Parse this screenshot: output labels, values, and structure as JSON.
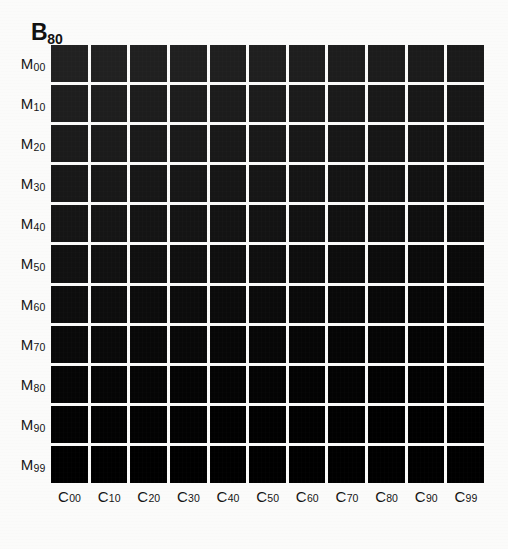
{
  "figure": {
    "title_base": "B",
    "title_sub": "80",
    "background_color": "#fbfbfa",
    "patch_border_color": "#ffffff"
  },
  "row_axis": {
    "label_base": "M",
    "labels": [
      {
        "base": "M",
        "sub": "00"
      },
      {
        "base": "M",
        "sub": "10"
      },
      {
        "base": "M",
        "sub": "20"
      },
      {
        "base": "M",
        "sub": "30"
      },
      {
        "base": "M",
        "sub": "40"
      },
      {
        "base": "M",
        "sub": "50"
      },
      {
        "base": "M",
        "sub": "60"
      },
      {
        "base": "M",
        "sub": "70"
      },
      {
        "base": "M",
        "sub": "80"
      },
      {
        "base": "M",
        "sub": "90"
      },
      {
        "base": "M",
        "sub": "99"
      }
    ]
  },
  "col_axis": {
    "label_base": "C",
    "labels": [
      {
        "base": "C",
        "sub": "00"
      },
      {
        "base": "C",
        "sub": "10"
      },
      {
        "base": "C",
        "sub": "20"
      },
      {
        "base": "C",
        "sub": "30"
      },
      {
        "base": "C",
        "sub": "40"
      },
      {
        "base": "C",
        "sub": "50"
      },
      {
        "base": "C",
        "sub": "60"
      },
      {
        "base": "C",
        "sub": "70"
      },
      {
        "base": "C",
        "sub": "80"
      },
      {
        "base": "C",
        "sub": "90"
      },
      {
        "base": "C",
        "sub": "99"
      }
    ]
  },
  "chart_data": {
    "type": "heatmap",
    "title": "B80",
    "xlabel": "",
    "ylabel": "",
    "grid": false,
    "legend_position": "none",
    "x": [
      "C00",
      "C10",
      "C20",
      "C30",
      "C40",
      "C50",
      "C60",
      "C70",
      "C80",
      "C90",
      "C99"
    ],
    "y": [
      "M00",
      "M10",
      "M20",
      "M30",
      "M40",
      "M50",
      "M60",
      "M70",
      "M80",
      "M90",
      "M99"
    ],
    "cell_colors": [
      [
        "#212121",
        "#212121",
        "#202020",
        "#202020",
        "#1f1f1f",
        "#1f1f1f",
        "#1e1e1e",
        "#1d1d1d",
        "#1c1c1c",
        "#1b1b1b",
        "#1a1a1a"
      ],
      [
        "#1e1e1e",
        "#1e1e1e",
        "#1d1d1d",
        "#1d1d1d",
        "#1c1c1c",
        "#1c1c1c",
        "#1b1b1b",
        "#1a1a1a",
        "#191919",
        "#181818",
        "#171717"
      ],
      [
        "#1b1b1b",
        "#1b1b1b",
        "#1a1a1a",
        "#1a1a1a",
        "#191919",
        "#191919",
        "#181818",
        "#171717",
        "#161616",
        "#151515",
        "#141414"
      ],
      [
        "#181818",
        "#181818",
        "#171717",
        "#171717",
        "#161616",
        "#161616",
        "#151515",
        "#141414",
        "#131313",
        "#121212",
        "#111111"
      ],
      [
        "#151515",
        "#151515",
        "#141414",
        "#141414",
        "#131313",
        "#131313",
        "#121212",
        "#111111",
        "#101010",
        "#0f0f0f",
        "#0e0e0e"
      ],
      [
        "#111111",
        "#111111",
        "#101010",
        "#101010",
        "#0f0f0f",
        "#0f0f0f",
        "#0e0e0e",
        "#0d0d0d",
        "#0c0c0c",
        "#0b0b0b",
        "#0a0a0a"
      ],
      [
        "#0d0d0d",
        "#0d0d0d",
        "#0c0c0c",
        "#0c0c0c",
        "#0b0b0b",
        "#0b0b0b",
        "#0a0a0a",
        "#090909",
        "#080808",
        "#070707",
        "#060606"
      ],
      [
        "#090909",
        "#090909",
        "#080808",
        "#080808",
        "#070707",
        "#070707",
        "#060606",
        "#050505",
        "#050505",
        "#040404",
        "#040404"
      ],
      [
        "#050505",
        "#050505",
        "#050505",
        "#040404",
        "#040404",
        "#040404",
        "#030303",
        "#030303",
        "#020202",
        "#020202",
        "#020202"
      ],
      [
        "#020202",
        "#020202",
        "#020202",
        "#020202",
        "#010101",
        "#010101",
        "#010101",
        "#010101",
        "#000000",
        "#000000",
        "#000000"
      ],
      [
        "#000000",
        "#000000",
        "#000000",
        "#000000",
        "#000000",
        "#000000",
        "#000000",
        "#000000",
        "#000000",
        "#000000",
        "#000000"
      ]
    ]
  }
}
